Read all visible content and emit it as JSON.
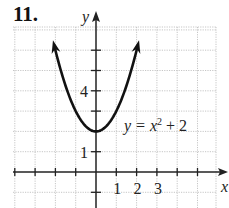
{
  "problem_number": "11.",
  "chart_data": {
    "type": "line",
    "title": "",
    "equation_label": "y = x² + 2",
    "equation_parts": {
      "lhs": "y = x",
      "exp": "2",
      "rhs": " + 2"
    },
    "xlabel": "x",
    "ylabel": "y",
    "xlim": [
      -4,
      6
    ],
    "ylim": [
      -2,
      7
    ],
    "grid": true,
    "grid_style": "dotted",
    "x_tick_labels": [
      "1",
      "2",
      "3"
    ],
    "y_tick_labels": [
      "1",
      "4"
    ],
    "series": [
      {
        "name": "y = x^2 + 2",
        "function": "x^2 + 2",
        "x": [
          -2.15,
          -2,
          -1.5,
          -1,
          -0.5,
          0,
          0.5,
          1,
          1.5,
          2,
          2.15
        ],
        "values": [
          6.62,
          6,
          4.25,
          3,
          2.25,
          2,
          2.25,
          3,
          4.25,
          6,
          6.62
        ],
        "vertex": [
          0,
          2
        ],
        "arrows_at_ends": true
      }
    ],
    "colors": {
      "curve": "#111111",
      "axis": "#222222",
      "grid": "#b8b8b8"
    }
  }
}
